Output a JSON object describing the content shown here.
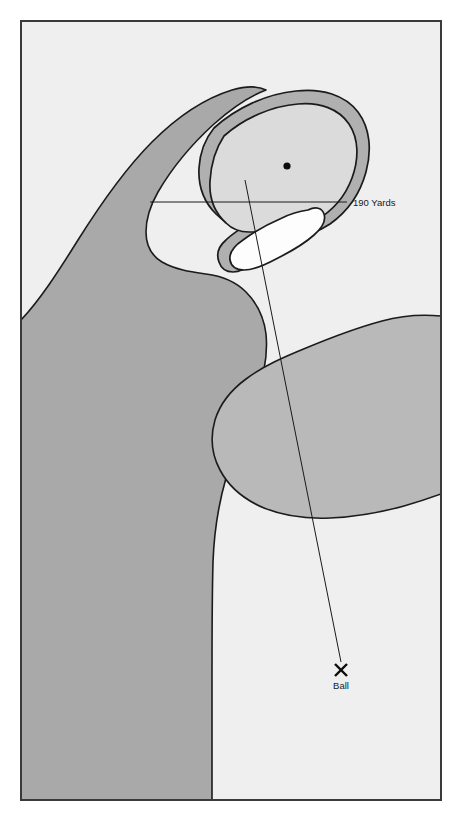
{
  "diagram": {
    "kind": "golf-hole-yardage-map",
    "frame": {
      "stroke_color": "#3a3a3a",
      "fill_color": "#efefef",
      "x": 20,
      "y": 20,
      "width": 422,
      "height": 781
    },
    "palette": {
      "page_background": "#ffffff",
      "in_play_background": "#efefef",
      "rough_dark": "#a9a9a9",
      "rough_medium": "#b9b9b9",
      "green_surface": "#dbdbdb",
      "collar_ring": "#b0b0b0",
      "bunker_sand": "#fdfdfd",
      "outline": "#1b1b1b",
      "line_color": "#1a1a1a",
      "text_color": "#1a1a1a"
    },
    "regions": [
      {
        "name": "left-rough",
        "label": "Left Rough / Trees",
        "fill": "#a9a9a9",
        "stroke": "#1b1b1b"
      },
      {
        "name": "right-rough",
        "label": "Right Rough",
        "fill": "#b9b9b9",
        "stroke": "#1b1b1b"
      },
      {
        "name": "green-collar",
        "label": "Green Collar",
        "fill": "#b0b0b0",
        "stroke": "#1b1b1b"
      },
      {
        "name": "putting-green",
        "label": "Putting Green",
        "fill": "#dbdbdb",
        "stroke": "#1b1b1b"
      },
      {
        "name": "greenside-bunker",
        "label": "Greenside Bunker",
        "fill": "#fdfdfd",
        "stroke": "#1b1b1b"
      },
      {
        "name": "fairway",
        "label": "Fairway",
        "fill": "#efefef",
        "stroke": "#1b1b1b"
      }
    ],
    "markers": {
      "pin": {
        "name": "pin-position",
        "label": "Pin",
        "x": 287,
        "y": 166,
        "radius": 3.6,
        "color": "#0d0d0d"
      },
      "ball": {
        "name": "ball-position",
        "label": "Ball",
        "marker_glyph": "X",
        "x": 341,
        "y": 669,
        "label_x": 341,
        "label_y": 687
      }
    },
    "measurements": {
      "yardage_line": {
        "name": "yardage-line",
        "label": "190 Yards",
        "x1": 150,
        "x2": 347,
        "y": 202,
        "label_x": 353,
        "label_y": 205
      },
      "aim_line": {
        "name": "aim-line",
        "label": "Line of play",
        "x1": 341,
        "y1": 662,
        "x2": 245,
        "y2": 180
      }
    }
  }
}
